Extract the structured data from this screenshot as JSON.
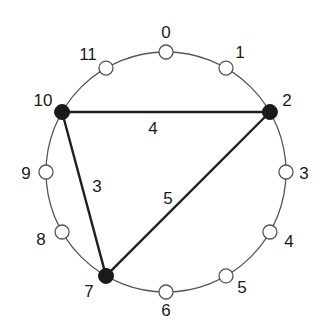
{
  "diagram": {
    "type": "circular-graph",
    "center": [
      166,
      172
    ],
    "radius": 120,
    "colors": {
      "circle": "#555555",
      "edge": "#1f1f1f",
      "open_node_fill": "#ffffff",
      "open_node_stroke": "#555555",
      "filled_node": "#1a1a1a",
      "text": "#1a1a1a"
    },
    "nodes": [
      {
        "id": "0",
        "label": "0",
        "angle_deg": 0,
        "filled": false
      },
      {
        "id": "1",
        "label": "1",
        "angle_deg": 30,
        "filled": false
      },
      {
        "id": "2",
        "label": "2",
        "angle_deg": 60,
        "filled": true
      },
      {
        "id": "3",
        "label": "3",
        "angle_deg": 90,
        "filled": false
      },
      {
        "id": "4",
        "label": "4",
        "angle_deg": 120,
        "filled": false
      },
      {
        "id": "5",
        "label": "5",
        "angle_deg": 150,
        "filled": false
      },
      {
        "id": "6",
        "label": "6",
        "angle_deg": 180,
        "filled": false
      },
      {
        "id": "7",
        "label": "7",
        "angle_deg": 210,
        "filled": true
      },
      {
        "id": "8",
        "label": "8",
        "angle_deg": 240,
        "filled": false
      },
      {
        "id": "9",
        "label": "9",
        "angle_deg": 270,
        "filled": false
      },
      {
        "id": "10",
        "label": "10",
        "angle_deg": 300,
        "filled": true
      },
      {
        "id": "11",
        "label": "11",
        "angle_deg": 330,
        "filled": false
      }
    ],
    "edges": [
      {
        "from": "10",
        "to": "2",
        "label": "4"
      },
      {
        "from": "10",
        "to": "7",
        "label": "3"
      },
      {
        "from": "2",
        "to": "7",
        "label": "5"
      }
    ]
  }
}
